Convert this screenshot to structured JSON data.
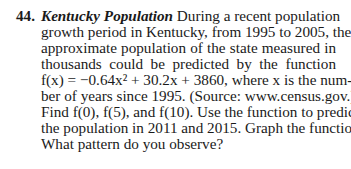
{
  "problem": {
    "number": "44.",
    "title": "Kentucky Population",
    "lines": [
      "During a recent population",
      "growth period in Kentucky, from 1995 to 2005, the",
      "approximate population of the state measured in",
      "thousands could be predicted by the function",
      "f(x) = −0.64x² + 30.2x + 3860, where x is the num-",
      "ber of years since 1995. (Source: www.census.gov.)",
      "Find f(0), f(5), and f(10). Use the function to predict",
      "the population in 2011 and 2015. Graph the function.",
      "What pattern do you observe?"
    ],
    "function": "f(x) = −0.64x² + 30.2x + 3860",
    "source_label": "Source:",
    "source_url": "www.census.gov."
  }
}
